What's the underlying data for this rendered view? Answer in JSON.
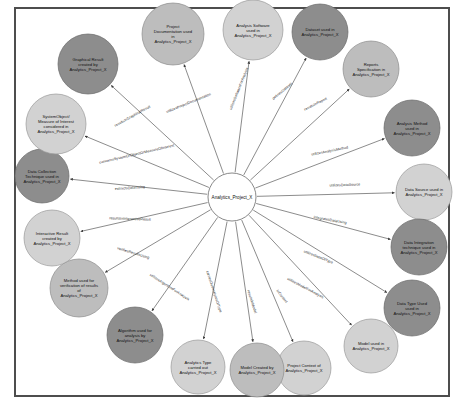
{
  "diagram": {
    "type": "knowledge-graph",
    "layout": "radial-star",
    "center_node": {
      "id": "analytics-project-x",
      "label": "Analytics_Project_X",
      "fill": "#ffffff",
      "radius": 24,
      "cx": 232,
      "cy": 197
    },
    "canvas": {
      "border_color": "#4d4d4d",
      "background": "#ffffff"
    },
    "palette": {
      "dark_node": "#8d8d8d",
      "mid_node": "#bdbdbd",
      "light_node": "#d2d2d2",
      "edge": "#5a5a5a",
      "text": "#111111"
    },
    "nodes": [
      {
        "id": "graphical-result",
        "label": "Graphical Result created by Analytics_Project_X",
        "lines": [
          "Graphical Result",
          "created by",
          "Analytics_Project_X"
        ],
        "cx": 88,
        "cy": 64,
        "r": 30,
        "shade": "dark"
      },
      {
        "id": "project-documentation",
        "label": "Project Documentation used in Analytics_Project_X",
        "lines": [
          "Project",
          "Documentation used",
          "in",
          "Analytics_Project_X"
        ],
        "cx": 173,
        "cy": 34,
        "r": 31,
        "shade": "mid"
      },
      {
        "id": "analysis-software",
        "label": "Analysis Software used in Analytics_Project_X",
        "lines": [
          "Analysis Software",
          "used in",
          "Analytics_Project_X"
        ],
        "cx": 253,
        "cy": 30,
        "r": 30,
        "shade": "light"
      },
      {
        "id": "dataset",
        "label": "Dataset used in Analytics_Project_X",
        "lines": [
          "Dataset used in",
          "Analytics_Project_X"
        ],
        "cx": 320,
        "cy": 32,
        "r": 28,
        "shade": "dark"
      },
      {
        "id": "reports-specification",
        "label": "Reports Specification in Analytics_Project_X",
        "lines": [
          "Reports",
          "Specification in",
          "Analytics_Project_X"
        ],
        "cx": 371,
        "cy": 69,
        "r": 28,
        "shade": "mid"
      },
      {
        "id": "analysis-method",
        "label": "Analysis Method used in Analytics_Project_X",
        "lines": [
          "Analysis Method",
          "used in",
          "Analytics_Project_X"
        ],
        "cx": 412,
        "cy": 128,
        "r": 28,
        "shade": "dark"
      },
      {
        "id": "data-source",
        "label": "Data Source used in Analytics_Project_X",
        "lines": [
          "Data Source used in",
          "Analytics_Project_X"
        ],
        "cx": 424,
        "cy": 192,
        "r": 28,
        "shade": "light"
      },
      {
        "id": "data-integration-technique",
        "label": "Data Integration technique used in Analytics_Project_X",
        "lines": [
          "Data Integration",
          "technique used in",
          "Analytics_Project_X"
        ],
        "cx": 419,
        "cy": 247,
        "r": 28,
        "shade": "dark"
      },
      {
        "id": "data-type-used",
        "label": "Data Type Used used in Analytics_Project_X",
        "lines": [
          "Data Type Used",
          "used in",
          "Analytics_Project_X"
        ],
        "cx": 412,
        "cy": 308,
        "r": 28,
        "shade": "dark"
      },
      {
        "id": "model-used",
        "label": "Model used in Analytics_Project_X",
        "lines": [
          "Model used in",
          "Analytics_Project_X"
        ],
        "cx": 371,
        "cy": 346,
        "r": 27,
        "shade": "light"
      },
      {
        "id": "project-context",
        "label": "Project Context of Analytics_Project_X",
        "lines": [
          "Project Context of",
          "Analytics_Project_X"
        ],
        "cx": 304,
        "cy": 368,
        "r": 27,
        "shade": "light"
      },
      {
        "id": "model-created-by",
        "label": "Model Created by Analytics_Project_X",
        "lines": [
          "Model Created by",
          "Analytics_Project_X"
        ],
        "cx": 257,
        "cy": 370,
        "r": 27,
        "shade": "mid"
      },
      {
        "id": "analytics-type",
        "label": "Analytics Type carried out Analytics_Project_X",
        "lines": [
          "Analytics Type",
          "carried out",
          "Analytics_Project_X"
        ],
        "cx": 198,
        "cy": 367,
        "r": 27,
        "shade": "light"
      },
      {
        "id": "algorithm-used",
        "label": "Algorithm used for analysis by Analytics_Project_X",
        "lines": [
          "Algorithm used for",
          "analysis by",
          "Analytics_Project_X"
        ],
        "cx": 135,
        "cy": 335,
        "r": 28,
        "shade": "dark"
      },
      {
        "id": "method-verification",
        "label": "Method used for verification of results of Analytics_Project_X",
        "lines": [
          "Method used for",
          "verification of results",
          "of",
          "Analytics_Project_X"
        ],
        "cx": 79,
        "cy": 288,
        "r": 29,
        "shade": "mid"
      },
      {
        "id": "interactive-result",
        "label": "Interactive Result created by Analytics_Project_X",
        "lines": [
          "Interactive Result",
          "created by",
          "Analytics_Project_X"
        ],
        "cx": 52,
        "cy": 238,
        "r": 28,
        "shade": "light"
      },
      {
        "id": "data-collection-technique",
        "label": "Data Collection Technique used in Analytics_Project_X",
        "lines": [
          "Data Collection",
          "Technique used in",
          "Analytics_Project_X"
        ],
        "cx": 42,
        "cy": 176,
        "r": 27,
        "shade": "dark"
      },
      {
        "id": "system-object-measure",
        "label": "SystemObject/ Measure of Interest considered in Analytics_Project_X",
        "lines": [
          "SystemObject/",
          "Measure of Interest",
          "considered in",
          "Analytics_Project_X"
        ],
        "cx": 56,
        "cy": 124,
        "r": 30,
        "shade": "light"
      }
    ],
    "edges": [
      {
        "id": "e-graphical-result",
        "target": "graphical-result",
        "label": "resultsInGraphicalResult",
        "label_x": 133,
        "label_y": 117,
        "label_rotate": -29
      },
      {
        "id": "e-project-documentation",
        "target": "project-documentation",
        "label": "utilizesProjectDocumentation",
        "label_x": 189,
        "label_y": 104,
        "label_rotate": -22
      },
      {
        "id": "e-analysis-software",
        "target": "analysis-software",
        "label": "utilizesSoftwareForAnalysis",
        "label_x": 240,
        "label_y": 89,
        "label_rotate": -68
      },
      {
        "id": "e-dataset",
        "target": "dataset",
        "label": "definesDataset",
        "label_x": 283,
        "label_y": 92,
        "label_rotate": -40
      },
      {
        "id": "e-reports-specification",
        "target": "reports-specification",
        "label": "resultsInReport",
        "label_x": 316,
        "label_y": 105,
        "label_rotate": -27
      },
      {
        "id": "e-analysis-method",
        "target": "analysis-method",
        "label": "utilizesAnalysisMethod",
        "label_x": 330,
        "label_y": 152,
        "label_rotate": -11
      },
      {
        "id": "e-data-source",
        "target": "data-source",
        "label": "utilizesDataSource",
        "label_x": 345,
        "label_y": 186,
        "label_rotate": -2
      },
      {
        "id": "e-data-integration",
        "target": "data-integration-technique",
        "label": "integratesDataUsing",
        "label_x": 330,
        "label_y": 221,
        "label_rotate": 10
      },
      {
        "id": "e-data-type",
        "target": "data-type-used",
        "label": "utilizesDataOfType",
        "label_x": 318,
        "label_y": 258,
        "label_rotate": 22
      },
      {
        "id": "e-model-used",
        "target": "model-used",
        "label": "utilizesModelForAnalysis",
        "label_x": 305,
        "label_y": 289,
        "label_rotate": 28
      },
      {
        "id": "e-project-context",
        "target": "project-context",
        "label": "inContext",
        "label_x": 281,
        "label_y": 297,
        "label_rotate": 52
      },
      {
        "id": "e-model-created",
        "target": "model-created-by",
        "label": "resultsInModel",
        "label_x": 251,
        "label_y": 302,
        "label_rotate": 72
      },
      {
        "id": "e-analytics-type",
        "target": "analytics-type",
        "label": "carriesOutAnalyticsOfType",
        "label_x": 213,
        "label_y": 292,
        "label_rotate": 72
      },
      {
        "id": "e-algorithm",
        "target": "algorithm-used",
        "label": "utilizesAlgorithmForAnalysis",
        "label_x": 169,
        "label_y": 288,
        "label_rotate": 33
      },
      {
        "id": "e-method-verification",
        "target": "method-verification",
        "label": "verifiesResultsUsing",
        "label_x": 133,
        "label_y": 254,
        "label_rotate": 17
      },
      {
        "id": "e-interactive-result",
        "target": "interactive-result",
        "label": "resultsInInteractiveResult",
        "label_x": 130,
        "label_y": 220,
        "label_rotate": 2
      },
      {
        "id": "e-data-collection",
        "target": "data-collection-technique",
        "label": "extractsDataUsing",
        "label_x": 130,
        "label_y": 189,
        "label_rotate": -4
      },
      {
        "id": "e-system-object",
        "target": "system-object-measure",
        "label": "concernsSystemOrObjectOrMeasureOfInterest",
        "label_x": 137,
        "label_y": 155,
        "label_rotate": -13
      }
    ]
  }
}
